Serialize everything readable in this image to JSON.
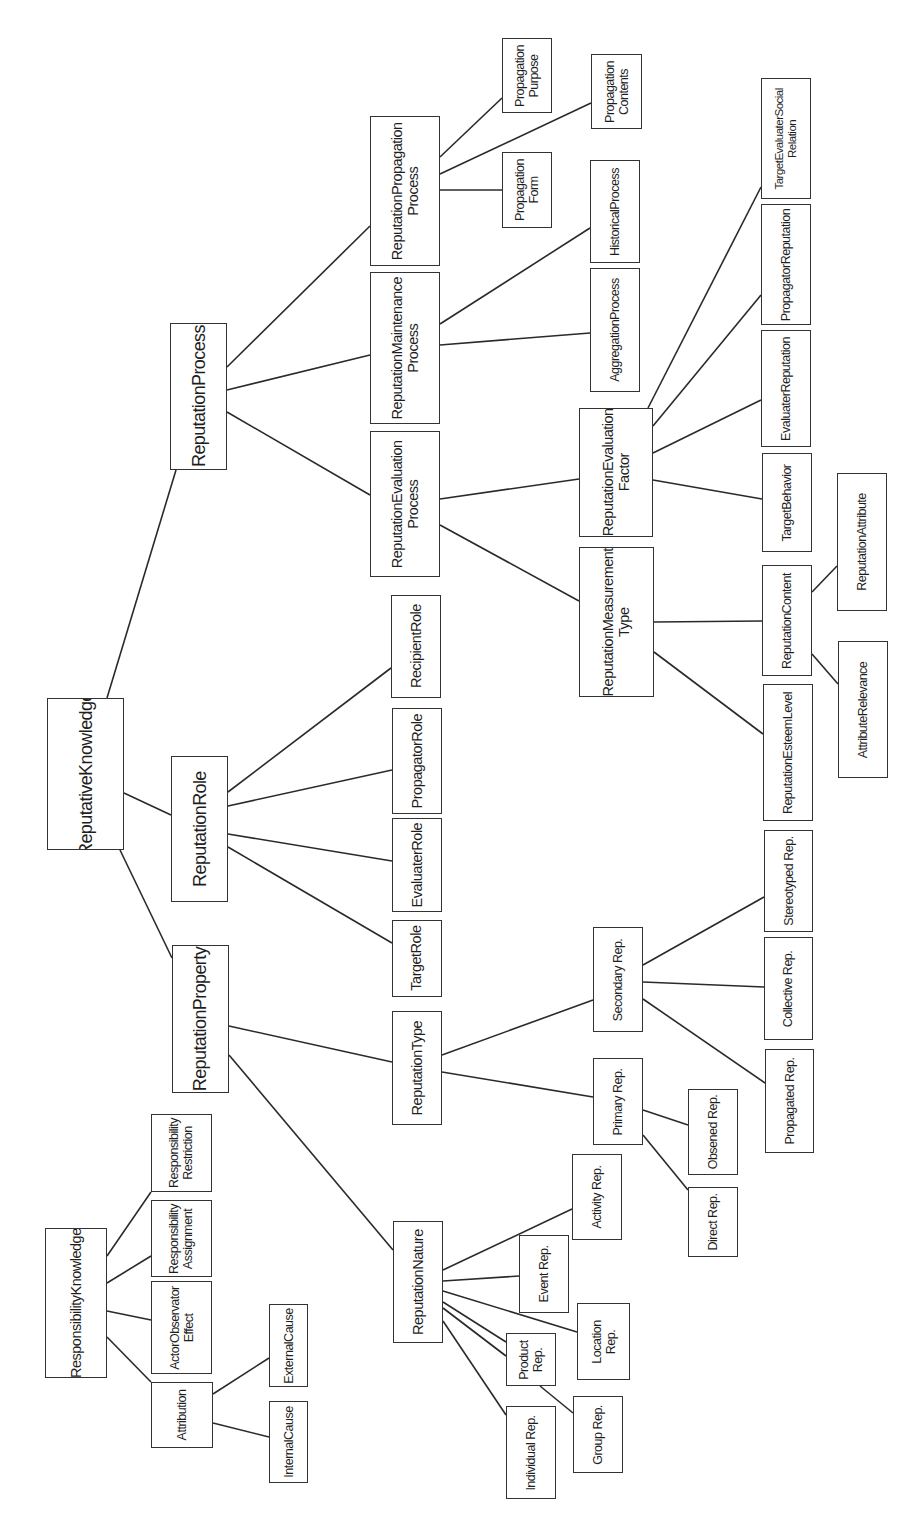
{
  "diagram": {
    "orientation": "rotated-90-ccw",
    "colors": {
      "background": "#ffffff",
      "line": "#2a2a2a",
      "box_border": "#333333",
      "text": "#1e1e1e"
    },
    "nodes": [
      {
        "id": "reputative_knowledge",
        "label": "ReputativeKnowledge",
        "x": 47,
        "y": 698,
        "w": 77,
        "h": 152,
        "size": "l"
      },
      {
        "id": "reputation_process",
        "label": "ReputationProcess",
        "x": 170,
        "y": 323,
        "w": 57,
        "h": 147,
        "size": "l"
      },
      {
        "id": "reputation_role",
        "label": "ReputationRole",
        "x": 171,
        "y": 756,
        "w": 57,
        "h": 146,
        "size": "l"
      },
      {
        "id": "reputation_property",
        "label": "ReputationProperty",
        "x": 172,
        "y": 945,
        "w": 57,
        "h": 148,
        "size": "l"
      },
      {
        "id": "propagation_process",
        "label": "ReputationPropagation\nProcess",
        "x": 370,
        "y": 116,
        "w": 70,
        "h": 150,
        "size": "m"
      },
      {
        "id": "maintenance_process",
        "label": "ReputationMaintenance\nProcess",
        "x": 370,
        "y": 272,
        "w": 70,
        "h": 152,
        "size": "m"
      },
      {
        "id": "evaluation_process",
        "label": "ReputationEvaluation\nProcess",
        "x": 370,
        "y": 431,
        "w": 70,
        "h": 146,
        "size": "m"
      },
      {
        "id": "propagation_purpose",
        "label": "Propagation\nPurpose",
        "x": 502,
        "y": 38,
        "w": 50,
        "h": 75,
        "size": "s"
      },
      {
        "id": "propagation_form",
        "label": "Propagation\nForm",
        "x": 502,
        "y": 152,
        "w": 50,
        "h": 76,
        "size": "s"
      },
      {
        "id": "propagation_contents",
        "label": "Propagation\nContents",
        "x": 591,
        "y": 54,
        "w": 51,
        "h": 75,
        "size": "s"
      },
      {
        "id": "historical_process",
        "label": "HistoricalProcess",
        "x": 590,
        "y": 160,
        "w": 50,
        "h": 103,
        "size": "s"
      },
      {
        "id": "aggregation_process",
        "label": "AggregationProcess",
        "x": 590,
        "y": 268,
        "w": 50,
        "h": 124,
        "size": "s"
      },
      {
        "id": "evaluation_factor",
        "label": "ReputationEvaluation\nFactor",
        "x": 579,
        "y": 408,
        "w": 74,
        "h": 129,
        "size": "m"
      },
      {
        "id": "measurement_type",
        "label": "ReputationMeasurement\nType",
        "x": 579,
        "y": 547,
        "w": 75,
        "h": 150,
        "size": "m"
      },
      {
        "id": "target_evaluater_social_relation",
        "label": "TargetEvaluaterSocial\nRelation",
        "x": 761,
        "y": 78,
        "w": 50,
        "h": 121,
        "size": "xs"
      },
      {
        "id": "propagator_reputation",
        "label": "PropagatorReputation",
        "x": 761,
        "y": 204,
        "w": 50,
        "h": 121,
        "size": "s"
      },
      {
        "id": "evaluater_reputation",
        "label": "EvaluaterReputation",
        "x": 761,
        "y": 330,
        "w": 50,
        "h": 117,
        "size": "s"
      },
      {
        "id": "target_behavior",
        "label": "TargetBehavior",
        "x": 762,
        "y": 453,
        "w": 50,
        "h": 99,
        "size": "s"
      },
      {
        "id": "reputation_content",
        "label": "ReputationContent",
        "x": 762,
        "y": 565,
        "w": 50,
        "h": 111,
        "size": "s"
      },
      {
        "id": "reputation_esteem_level",
        "label": "ReputationEsteemLevel",
        "x": 763,
        "y": 684,
        "w": 50,
        "h": 137,
        "size": "s"
      },
      {
        "id": "reputation_attribute",
        "label": "ReputationAttribute",
        "x": 837,
        "y": 473,
        "w": 50,
        "h": 138,
        "size": "s"
      },
      {
        "id": "attribute_relevance",
        "label": "AttributeRelevance",
        "x": 838,
        "y": 641,
        "w": 50,
        "h": 137,
        "size": "s"
      },
      {
        "id": "recipient_role",
        "label": "RecipientRole",
        "x": 391,
        "y": 595,
        "w": 50,
        "h": 103,
        "size": "m"
      },
      {
        "id": "propagator_role",
        "label": "PropagatorRole",
        "x": 392,
        "y": 708,
        "w": 50,
        "h": 106,
        "size": "m"
      },
      {
        "id": "evaluater_role",
        "label": "EvaluaterRole",
        "x": 392,
        "y": 818,
        "w": 50,
        "h": 94,
        "size": "m"
      },
      {
        "id": "target_role",
        "label": "TargetRole",
        "x": 392,
        "y": 920,
        "w": 50,
        "h": 77,
        "size": "m"
      },
      {
        "id": "reputation_type",
        "label": "ReputationType",
        "x": 392,
        "y": 1011,
        "w": 50,
        "h": 114,
        "size": "m"
      },
      {
        "id": "reputation_nature",
        "label": "ReputationNature",
        "x": 393,
        "y": 1221,
        "w": 50,
        "h": 122,
        "size": "m"
      },
      {
        "id": "secondary_rep",
        "label": "Secondary Rep.",
        "x": 593,
        "y": 927,
        "w": 50,
        "h": 105,
        "size": "s"
      },
      {
        "id": "primary_rep",
        "label": "Primary Rep.",
        "x": 593,
        "y": 1058,
        "w": 50,
        "h": 87,
        "size": "s"
      },
      {
        "id": "stereotyped_rep",
        "label": "Stereotyped Rep.",
        "x": 764,
        "y": 830,
        "w": 49,
        "h": 102,
        "size": "s"
      },
      {
        "id": "collective_rep",
        "label": "Collective Rep.",
        "x": 764,
        "y": 937,
        "w": 49,
        "h": 103,
        "size": "s"
      },
      {
        "id": "propagated_rep",
        "label": "Propagated Rep.",
        "x": 765,
        "y": 1049,
        "w": 49,
        "h": 104,
        "size": "s"
      },
      {
        "id": "obsened_rep",
        "label": "Obsened Rep.",
        "x": 688,
        "y": 1089,
        "w": 50,
        "h": 86,
        "size": "s"
      },
      {
        "id": "direct_rep",
        "label": "Direct Rep.",
        "x": 688,
        "y": 1187,
        "w": 50,
        "h": 70,
        "size": "s"
      },
      {
        "id": "activity_rep",
        "label": "Activity Rep.",
        "x": 572,
        "y": 1154,
        "w": 50,
        "h": 86,
        "size": "s"
      },
      {
        "id": "event_rep",
        "label": "Event Rep.",
        "x": 519,
        "y": 1235,
        "w": 50,
        "h": 78,
        "size": "s"
      },
      {
        "id": "location_rep",
        "label": "Location\nRep.",
        "x": 577,
        "y": 1303,
        "w": 53,
        "h": 77,
        "size": "s"
      },
      {
        "id": "product_rep",
        "label": "Product\nRep.",
        "x": 506,
        "y": 1333,
        "w": 50,
        "h": 53,
        "size": "s"
      },
      {
        "id": "group_rep",
        "label": "Group Rep.",
        "x": 573,
        "y": 1396,
        "w": 50,
        "h": 77,
        "size": "s"
      },
      {
        "id": "individual_rep",
        "label": "Individual Rep.",
        "x": 506,
        "y": 1406,
        "w": 50,
        "h": 93,
        "size": "s"
      },
      {
        "id": "responsibility_knowledge",
        "label": "ResponsibilityKnowledge",
        "x": 45,
        "y": 1228,
        "w": 62,
        "h": 150,
        "size": "m"
      },
      {
        "id": "responsibility_restriction",
        "label": "Responsibility\nRestriction",
        "x": 151,
        "y": 1114,
        "w": 61,
        "h": 78,
        "size": "s"
      },
      {
        "id": "responsibility_assignment",
        "label": "Responsibility\nAssignment",
        "x": 151,
        "y": 1200,
        "w": 61,
        "h": 77,
        "size": "s"
      },
      {
        "id": "actor_observer_effect",
        "label": "ActorObservator\nEffect",
        "x": 151,
        "y": 1281,
        "w": 61,
        "h": 93,
        "size": "s"
      },
      {
        "id": "attribution",
        "label": "Attribution",
        "x": 151,
        "y": 1382,
        "w": 62,
        "h": 66,
        "size": "s"
      },
      {
        "id": "external_cause",
        "label": "ExternalCause",
        "x": 269,
        "y": 1304,
        "w": 39,
        "h": 83,
        "size": "s"
      },
      {
        "id": "internal_cause",
        "label": "InternalCause",
        "x": 269,
        "y": 1401,
        "w": 39,
        "h": 82,
        "size": "s"
      }
    ],
    "edges": [
      {
        "from": "reputative_knowledge",
        "to": "reputation_process",
        "x1": 107,
        "y1": 698,
        "x2": 176,
        "y2": 470
      },
      {
        "from": "reputative_knowledge",
        "to": "reputation_role",
        "x1": 124,
        "y1": 793,
        "x2": 171,
        "y2": 815
      },
      {
        "from": "reputative_knowledge",
        "to": "reputation_property",
        "x1": 120,
        "y1": 850,
        "x2": 172,
        "y2": 958
      },
      {
        "from": "reputation_process",
        "to": "propagation_process",
        "x1": 227,
        "y1": 367,
        "x2": 370,
        "y2": 226
      },
      {
        "from": "reputation_process",
        "to": "maintenance_process",
        "x1": 227,
        "y1": 390,
        "x2": 370,
        "y2": 355
      },
      {
        "from": "reputation_process",
        "to": "evaluation_process",
        "x1": 227,
        "y1": 412,
        "x2": 370,
        "y2": 495
      },
      {
        "from": "propagation_process",
        "to": "propagation_purpose",
        "x1": 440,
        "y1": 157,
        "x2": 502,
        "y2": 98
      },
      {
        "from": "propagation_process",
        "to": "propagation_contents",
        "x1": 440,
        "y1": 174,
        "x2": 591,
        "y2": 103
      },
      {
        "from": "propagation_process",
        "to": "propagation_form",
        "x1": 440,
        "y1": 190,
        "x2": 502,
        "y2": 190
      },
      {
        "from": "maintenance_process",
        "to": "historical_process",
        "x1": 440,
        "y1": 324,
        "x2": 590,
        "y2": 228
      },
      {
        "from": "maintenance_process",
        "to": "aggregation_process",
        "x1": 440,
        "y1": 345,
        "x2": 590,
        "y2": 333
      },
      {
        "from": "evaluation_process",
        "to": "evaluation_factor",
        "x1": 440,
        "y1": 499,
        "x2": 579,
        "y2": 479
      },
      {
        "from": "evaluation_process",
        "to": "measurement_type",
        "x1": 440,
        "y1": 525,
        "x2": 579,
        "y2": 601
      },
      {
        "from": "evaluation_factor",
        "to": "target_evaluater_social_relation",
        "x1": 648,
        "y1": 408,
        "x2": 761,
        "y2": 187
      },
      {
        "from": "evaluation_factor",
        "to": "propagator_reputation",
        "x1": 653,
        "y1": 426,
        "x2": 761,
        "y2": 295
      },
      {
        "from": "evaluation_factor",
        "to": "evaluater_reputation",
        "x1": 653,
        "y1": 453,
        "x2": 761,
        "y2": 400
      },
      {
        "from": "evaluation_factor",
        "to": "target_behavior",
        "x1": 653,
        "y1": 480,
        "x2": 762,
        "y2": 499
      },
      {
        "from": "measurement_type",
        "to": "reputation_content",
        "x1": 654,
        "y1": 622,
        "x2": 762,
        "y2": 621
      },
      {
        "from": "measurement_type",
        "to": "reputation_esteem_level",
        "x1": 654,
        "y1": 652,
        "x2": 763,
        "y2": 734
      },
      {
        "from": "reputation_content",
        "to": "reputation_attribute",
        "x1": 812,
        "y1": 592,
        "x2": 837,
        "y2": 566
      },
      {
        "from": "reputation_content",
        "to": "attribute_relevance",
        "x1": 812,
        "y1": 654,
        "x2": 838,
        "y2": 684
      },
      {
        "from": "reputation_role",
        "to": "recipient_role",
        "x1": 228,
        "y1": 792,
        "x2": 391,
        "y2": 668
      },
      {
        "from": "reputation_role",
        "to": "propagator_role",
        "x1": 228,
        "y1": 806,
        "x2": 392,
        "y2": 770
      },
      {
        "from": "reputation_role",
        "to": "evaluater_role",
        "x1": 228,
        "y1": 834,
        "x2": 392,
        "y2": 861
      },
      {
        "from": "reputation_role",
        "to": "target_role",
        "x1": 228,
        "y1": 847,
        "x2": 392,
        "y2": 943
      },
      {
        "from": "reputation_property",
        "to": "reputation_type",
        "x1": 229,
        "y1": 1026,
        "x2": 392,
        "y2": 1062
      },
      {
        "from": "reputation_property",
        "to": "reputation_nature",
        "x1": 229,
        "y1": 1055,
        "x2": 393,
        "y2": 1250
      },
      {
        "from": "reputation_type",
        "to": "secondary_rep",
        "x1": 442,
        "y1": 1055,
        "x2": 593,
        "y2": 1000
      },
      {
        "from": "reputation_type",
        "to": "primary_rep",
        "x1": 442,
        "y1": 1072,
        "x2": 593,
        "y2": 1097
      },
      {
        "from": "secondary_rep",
        "to": "stereotyped_rep",
        "x1": 643,
        "y1": 965,
        "x2": 764,
        "y2": 897
      },
      {
        "from": "secondary_rep",
        "to": "collective_rep",
        "x1": 643,
        "y1": 982,
        "x2": 764,
        "y2": 987
      },
      {
        "from": "secondary_rep",
        "to": "propagated_rep",
        "x1": 643,
        "y1": 999,
        "x2": 765,
        "y2": 1083
      },
      {
        "from": "primary_rep",
        "to": "obsened_rep",
        "x1": 643,
        "y1": 1110,
        "x2": 688,
        "y2": 1125
      },
      {
        "from": "primary_rep",
        "to": "direct_rep",
        "x1": 643,
        "y1": 1135,
        "x2": 688,
        "y2": 1190
      },
      {
        "from": "reputation_nature",
        "to": "activity_rep",
        "x1": 443,
        "y1": 1270,
        "x2": 572,
        "y2": 1209
      },
      {
        "from": "reputation_nature",
        "to": "event_rep",
        "x1": 443,
        "y1": 1281,
        "x2": 519,
        "y2": 1276
      },
      {
        "from": "reputation_nature",
        "to": "location_rep",
        "x1": 443,
        "y1": 1291,
        "x2": 577,
        "y2": 1332
      },
      {
        "from": "reputation_nature",
        "to": "product_rep_a",
        "x1": 443,
        "y1": 1302,
        "x2": 506,
        "y2": 1342
      },
      {
        "from": "reputation_nature",
        "to": "product_rep_b",
        "x1": 443,
        "y1": 1308,
        "x2": 506,
        "y2": 1356
      },
      {
        "from": "reputation_nature",
        "to": "individual_rep",
        "x1": 443,
        "y1": 1321,
        "x2": 506,
        "y2": 1415
      },
      {
        "from": "product_rep",
        "to": "group_rep",
        "x1": 540,
        "y1": 1386,
        "x2": 573,
        "y2": 1413
      },
      {
        "from": "responsibility_knowledge",
        "to": "responsibility_restriction",
        "x1": 107,
        "y1": 1256,
        "x2": 151,
        "y2": 1192
      },
      {
        "from": "responsibility_knowledge",
        "to": "responsibility_assignment",
        "x1": 107,
        "y1": 1283,
        "x2": 151,
        "y2": 1256
      },
      {
        "from": "responsibility_knowledge",
        "to": "actor_observer_effect",
        "x1": 107,
        "y1": 1311,
        "x2": 151,
        "y2": 1320
      },
      {
        "from": "responsibility_knowledge",
        "to": "attribution",
        "x1": 107,
        "y1": 1337,
        "x2": 151,
        "y2": 1382
      },
      {
        "from": "attribution",
        "to": "external_cause",
        "x1": 213,
        "y1": 1394,
        "x2": 269,
        "y2": 1358
      },
      {
        "from": "attribution",
        "to": "internal_cause",
        "x1": 213,
        "y1": 1423,
        "x2": 269,
        "y2": 1437
      }
    ]
  }
}
